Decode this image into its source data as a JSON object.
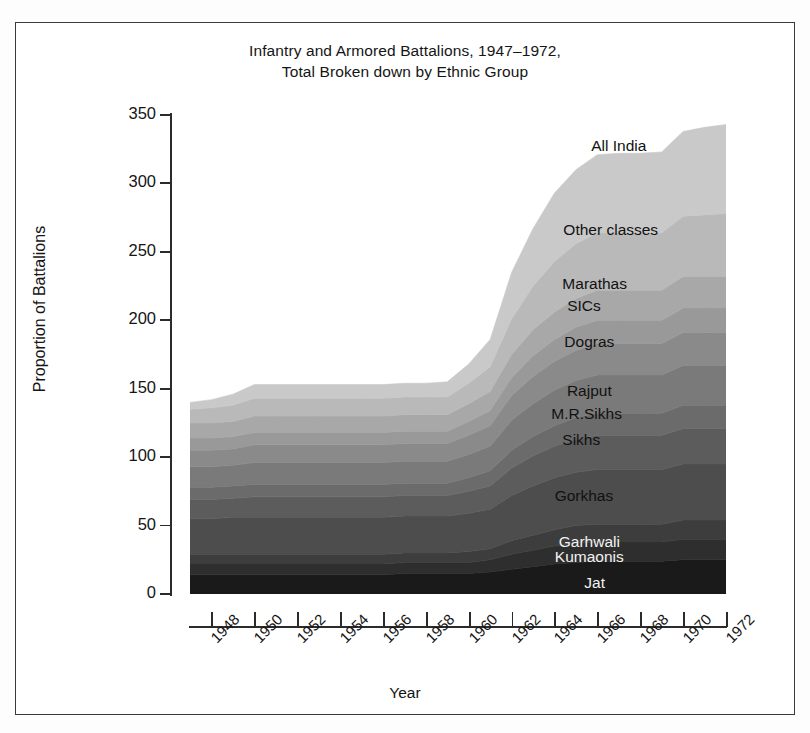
{
  "figure": {
    "title_line1": "Infantry and Armored Battalions, 1947–1972,",
    "title_line2": "Total Broken down by Ethnic Group",
    "xtitle": "Year",
    "ytitle": "Proportion of Battalions"
  },
  "axes": {
    "y_ticks": [
      "0",
      "50",
      "100",
      "150",
      "200",
      "250",
      "300",
      "350"
    ],
    "x_ticks": [
      "1948",
      "1950",
      "1952",
      "1954",
      "1956",
      "1958",
      "1960",
      "1962",
      "1964",
      "1966",
      "1968",
      "1970",
      "1972"
    ]
  },
  "series_labels": [
    {
      "text": "All India",
      "x": 0.8,
      "y": 0.935,
      "tone": "dark"
    },
    {
      "text": "Other classes",
      "x": 0.785,
      "y": 0.76,
      "tone": "dark"
    },
    {
      "text": "Marathas",
      "x": 0.755,
      "y": 0.648,
      "tone": "dark"
    },
    {
      "text": "SICs",
      "x": 0.735,
      "y": 0.602,
      "tone": "dark"
    },
    {
      "text": "Dogras",
      "x": 0.745,
      "y": 0.527,
      "tone": "dark"
    },
    {
      "text": "Rajput",
      "x": 0.745,
      "y": 0.424,
      "tone": "dark"
    },
    {
      "text": "M.R.Sikhs",
      "x": 0.74,
      "y": 0.376,
      "tone": "dark"
    },
    {
      "text": "Sikhs",
      "x": 0.73,
      "y": 0.322,
      "tone": "dark"
    },
    {
      "text": "Gorkhas",
      "x": 0.735,
      "y": 0.205,
      "tone": "dark"
    },
    {
      "text": "Garhwali",
      "x": 0.745,
      "y": 0.108,
      "tone": "light"
    },
    {
      "text": "Kumaonis",
      "x": 0.745,
      "y": 0.077,
      "tone": "light"
    },
    {
      "text": "Jat",
      "x": 0.755,
      "y": 0.022,
      "tone": "light"
    }
  ],
  "chart_data": {
    "type": "area",
    "stacked": true,
    "title": "Infantry and Armored Battalions, 1947–1972, Total Broken down by Ethnic Group",
    "xlabel": "Year",
    "ylabel": "Proportion of Battalions",
    "xlim": [
      1947,
      1972
    ],
    "ylim": [
      0,
      350
    ],
    "ytick_step": 50,
    "grid": false,
    "legend": "inline-labels",
    "x": [
      1947,
      1948,
      1949,
      1950,
      1951,
      1952,
      1953,
      1954,
      1955,
      1956,
      1957,
      1958,
      1959,
      1960,
      1961,
      1962,
      1963,
      1964,
      1965,
      1966,
      1967,
      1968,
      1969,
      1970,
      1971,
      1972
    ],
    "series": [
      {
        "name": "Jat",
        "color": "#1a1a1a",
        "values": [
          14,
          14,
          14,
          14,
          14,
          14,
          14,
          14,
          14,
          14,
          15,
          15,
          15,
          15,
          16,
          18,
          20,
          22,
          23,
          24,
          24,
          24,
          24,
          25,
          25,
          25
        ]
      },
      {
        "name": "Kumaonis",
        "color": "#2e2e2e",
        "values": [
          8,
          8,
          8,
          8,
          8,
          8,
          8,
          8,
          8,
          8,
          8,
          8,
          8,
          8,
          9,
          11,
          12,
          13,
          14,
          14,
          14,
          14,
          14,
          15,
          15,
          15
        ]
      },
      {
        "name": "Garhwali",
        "color": "#3d3d3d",
        "values": [
          7,
          7,
          7,
          7,
          7,
          7,
          7,
          7,
          7,
          7,
          7,
          7,
          7,
          8,
          8,
          10,
          11,
          12,
          13,
          13,
          13,
          13,
          13,
          14,
          14,
          14
        ]
      },
      {
        "name": "Gorkhas",
        "color": "#4d4d4d",
        "values": [
          26,
          26,
          27,
          27,
          27,
          27,
          27,
          27,
          27,
          27,
          27,
          27,
          27,
          28,
          29,
          33,
          36,
          38,
          39,
          40,
          40,
          40,
          40,
          41,
          41,
          41
        ]
      },
      {
        "name": "Sikhs",
        "color": "#5c5c5c",
        "values": [
          14,
          14,
          14,
          15,
          15,
          15,
          15,
          15,
          15,
          15,
          15,
          15,
          15,
          16,
          17,
          20,
          22,
          23,
          24,
          25,
          25,
          25,
          25,
          26,
          26,
          26
        ]
      },
      {
        "name": "M.R.Sikhs",
        "color": "#6b6b6b",
        "values": [
          9,
          9,
          9,
          9,
          9,
          9,
          9,
          9,
          9,
          9,
          9,
          9,
          9,
          10,
          11,
          13,
          14,
          15,
          16,
          16,
          16,
          16,
          16,
          17,
          17,
          17
        ]
      },
      {
        "name": "Rajput",
        "color": "#7a7a7a",
        "values": [
          15,
          15,
          15,
          16,
          16,
          16,
          16,
          16,
          16,
          16,
          16,
          16,
          16,
          17,
          18,
          22,
          24,
          26,
          27,
          28,
          28,
          28,
          28,
          29,
          29,
          29
        ]
      },
      {
        "name": "Dogras",
        "color": "#8a8a8a",
        "values": [
          12,
          12,
          12,
          13,
          13,
          13,
          13,
          13,
          13,
          13,
          13,
          13,
          13,
          14,
          15,
          18,
          20,
          21,
          22,
          23,
          23,
          23,
          23,
          24,
          24,
          24
        ]
      },
      {
        "name": "SICs",
        "color": "#999999",
        "values": [
          9,
          9,
          9,
          9,
          9,
          9,
          9,
          9,
          9,
          9,
          9,
          9,
          9,
          10,
          11,
          13,
          15,
          16,
          17,
          17,
          17,
          17,
          17,
          18,
          18,
          18
        ]
      },
      {
        "name": "Marathas",
        "color": "#a8a8a8",
        "values": [
          11,
          11,
          11,
          12,
          12,
          12,
          12,
          12,
          12,
          12,
          12,
          12,
          12,
          13,
          14,
          17,
          19,
          20,
          21,
          22,
          22,
          22,
          22,
          23,
          23,
          23
        ]
      },
      {
        "name": "Other classes",
        "color": "#b9b9b9",
        "values": [
          10,
          11,
          12,
          13,
          13,
          13,
          13,
          13,
          13,
          13,
          13,
          13,
          13,
          15,
          18,
          26,
          32,
          37,
          40,
          42,
          42,
          42,
          42,
          44,
          45,
          46
        ]
      },
      {
        "name": "All India",
        "color": "#c9c9c9",
        "values": [
          5,
          6,
          8,
          10,
          10,
          10,
          10,
          10,
          10,
          10,
          10,
          10,
          11,
          14,
          20,
          34,
          42,
          50,
          54,
          57,
          58,
          58,
          59,
          62,
          64,
          65
        ]
      }
    ],
    "totals": [
      140,
      142,
      146,
      153,
      153,
      153,
      153,
      153,
      153,
      153,
      154,
      154,
      155,
      168,
      186,
      235,
      267,
      293,
      310,
      321,
      322,
      322,
      323,
      338,
      341,
      343
    ]
  }
}
